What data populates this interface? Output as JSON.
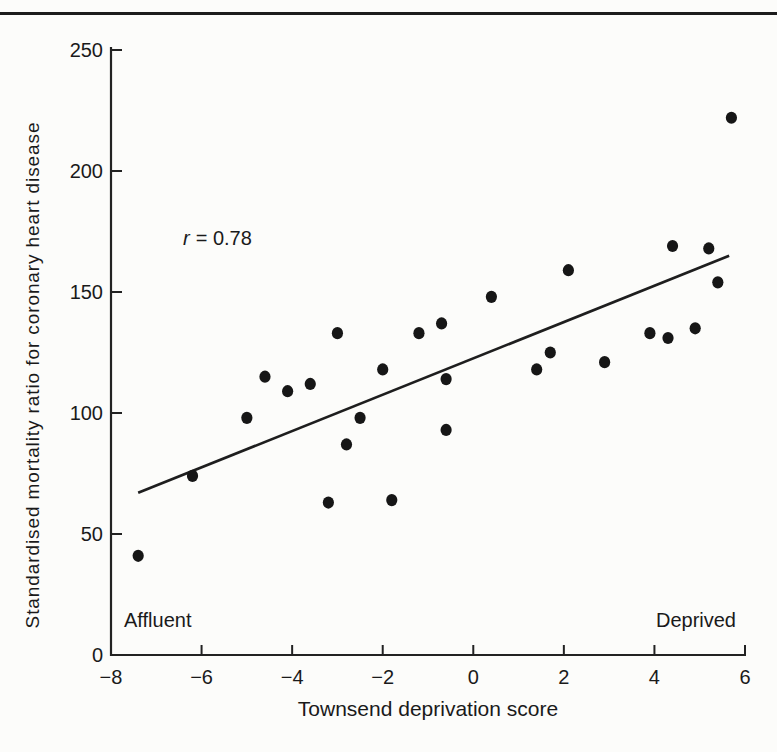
{
  "page": {
    "background": "#fcfcfa",
    "rule_color": "#1c1c1c"
  },
  "chart_data": {
    "type": "scatter",
    "title": "",
    "xlabel": "Townsend deprivation score",
    "ylabel": "Standardised mortality ratio for coronary heart disease",
    "xlim": [
      -8,
      6
    ],
    "ylim": [
      0,
      250
    ],
    "x_ticks": [
      -8,
      -6,
      -4,
      -2,
      0,
      2,
      4,
      6
    ],
    "y_ticks": [
      0,
      50,
      100,
      150,
      200,
      250
    ],
    "grid": false,
    "legend": null,
    "point_color": "#161616",
    "line_color": "#1e1e1e",
    "axis_color": "#222222",
    "annotation": {
      "symbol": "r",
      "rest": "= 0.78",
      "x": -5.7,
      "y": 171
    },
    "corner_labels": {
      "left": "Affluent",
      "right": "Deprived"
    },
    "r_value": 0.78,
    "points": [
      [
        -7.4,
        41
      ],
      [
        -6.2,
        74
      ],
      [
        -5.0,
        98
      ],
      [
        -4.6,
        115
      ],
      [
        -4.1,
        109
      ],
      [
        -3.6,
        112
      ],
      [
        -3.2,
        63
      ],
      [
        -3.0,
        133
      ],
      [
        -2.8,
        87
      ],
      [
        -2.5,
        98
      ],
      [
        -2.0,
        118
      ],
      [
        -1.8,
        64
      ],
      [
        -1.2,
        133
      ],
      [
        -0.7,
        137
      ],
      [
        -0.6,
        114
      ],
      [
        -0.6,
        93
      ],
      [
        0.4,
        148
      ],
      [
        1.4,
        118
      ],
      [
        1.7,
        125
      ],
      [
        2.1,
        159
      ],
      [
        2.9,
        121
      ],
      [
        3.9,
        133
      ],
      [
        4.3,
        131
      ],
      [
        4.4,
        169
      ],
      [
        4.9,
        135
      ],
      [
        5.2,
        168
      ],
      [
        5.4,
        154
      ],
      [
        5.7,
        222
      ]
    ],
    "regression_line": {
      "x1": -7.4,
      "y1": 67,
      "x2": 5.65,
      "y2": 165
    }
  }
}
